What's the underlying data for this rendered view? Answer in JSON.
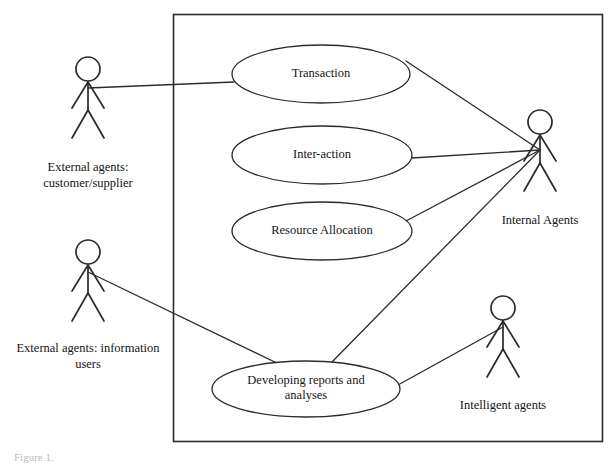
{
  "diagram": {
    "kind": "uml-use-case-diagram",
    "background_color": "#ffffff",
    "line_color": "#2b2b2b",
    "text_color": "#141414",
    "system_boundary": {
      "name": "system-boundary",
      "x": 173,
      "y": 14,
      "width": 429,
      "height": 427,
      "label": ""
    },
    "use_cases": [
      {
        "id": "transaction",
        "label": "Transaction",
        "cx": 321,
        "cy": 74,
        "rx": 89,
        "ry": 29
      },
      {
        "id": "interaction",
        "label": "Inter-action",
        "cx": 322,
        "cy": 155,
        "rx": 90,
        "ry": 29
      },
      {
        "id": "resource-allocation",
        "label": "Resource Allocation",
        "cx": 322,
        "cy": 231,
        "rx": 90,
        "ry": 29
      },
      {
        "id": "developing-reports",
        "label": "Developing reports and\nanalyses",
        "cx": 306,
        "cy": 389,
        "rx": 94,
        "ry": 28
      }
    ],
    "actors": [
      {
        "id": "external-customer-supplier",
        "label": "External agents:\ncustomer/supplier",
        "x": 88,
        "y": 57,
        "label_y": 160,
        "label_width": 150
      },
      {
        "id": "internal-agents",
        "label": "Internal Agents",
        "x": 540,
        "y": 110,
        "label_y": 213,
        "label_width": 150
      },
      {
        "id": "external-information-users",
        "label": "External agents: information\nusers",
        "x": 88,
        "y": 240,
        "label_y": 341,
        "label_width": 190
      },
      {
        "id": "intelligent-agents",
        "label": "Intelligent agents",
        "x": 503,
        "y": 296,
        "label_y": 398,
        "label_width": 160
      }
    ],
    "associations": [
      {
        "id": "ext-customer-to-transaction",
        "from": "external-customer-supplier",
        "to": "transaction",
        "x1": 88,
        "y1": 88,
        "x2": 234,
        "y2": 82
      },
      {
        "id": "transaction-to-internal",
        "from": "transaction",
        "to": "internal-agents",
        "x1": 406,
        "y1": 61,
        "x2": 540,
        "y2": 150
      },
      {
        "id": "interaction-to-internal",
        "from": "interaction",
        "to": "internal-agents",
        "x1": 412,
        "y1": 158,
        "x2": 540,
        "y2": 150
      },
      {
        "id": "resource-allocation-to-internal",
        "from": "resource-allocation",
        "to": "internal-agents",
        "x1": 406,
        "y1": 221,
        "x2": 540,
        "y2": 150
      },
      {
        "id": "developing-reports-to-internal",
        "from": "developing-reports",
        "to": "internal-agents",
        "x1": 331,
        "y1": 363,
        "x2": 540,
        "y2": 150
      },
      {
        "id": "ext-info-users-to-developing-reports",
        "from": "external-information-users",
        "to": "developing-reports",
        "x1": 88,
        "y1": 272,
        "x2": 283,
        "y2": 366
      },
      {
        "id": "intelligent-agents-to-developing-reports",
        "from": "intelligent-agents",
        "to": "developing-reports",
        "x1": 503,
        "y1": 327,
        "x2": 398,
        "y2": 385
      }
    ],
    "caption": "Figure 1."
  }
}
